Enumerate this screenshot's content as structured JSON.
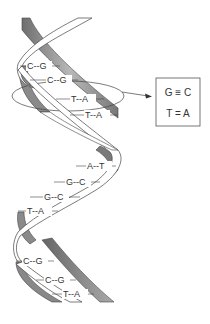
{
  "diagram": {
    "base_pairs": [
      {
        "label": "C--G",
        "x": 28,
        "y": 69
      },
      {
        "label": "C--G",
        "x": 48,
        "y": 83
      },
      {
        "label": "T--A",
        "x": 72,
        "y": 102
      },
      {
        "label": "T--A",
        "x": 86,
        "y": 118
      },
      {
        "label": "A--T",
        "x": 88,
        "y": 169
      },
      {
        "label": "G--C",
        "x": 67,
        "y": 185
      },
      {
        "label": "G--C",
        "x": 45,
        "y": 200
      },
      {
        "label": "T--A",
        "x": 28,
        "y": 214
      },
      {
        "label": "C--G",
        "x": 24,
        "y": 264
      },
      {
        "label": "C--G",
        "x": 46,
        "y": 283
      },
      {
        "label": "T--A",
        "x": 64,
        "y": 297
      }
    ],
    "legend": {
      "line1": "G ≡ C",
      "line2": "T = A"
    },
    "colors": {
      "strand_dark": "#7a7a7a",
      "strand_light": "#ffffff",
      "outline": "#444444",
      "text": "#333333"
    }
  }
}
